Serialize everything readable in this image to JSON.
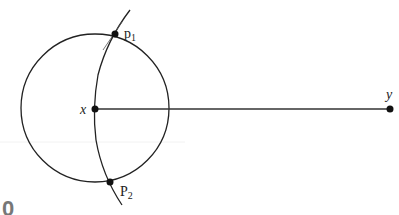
{
  "diagram": {
    "points": {
      "x": {
        "label": "x",
        "cx": 95,
        "cy": 109
      },
      "y": {
        "label": "y",
        "cx": 390,
        "cy": 109
      },
      "p1": {
        "label": "p",
        "sub": "1",
        "cx": 115,
        "cy": 34
      },
      "p2": {
        "label": "P",
        "sub": "2",
        "cx": 110,
        "cy": 182
      }
    },
    "circle": {
      "cx": 95,
      "cy": 108,
      "r": 74
    },
    "partial_glyph": "0"
  }
}
